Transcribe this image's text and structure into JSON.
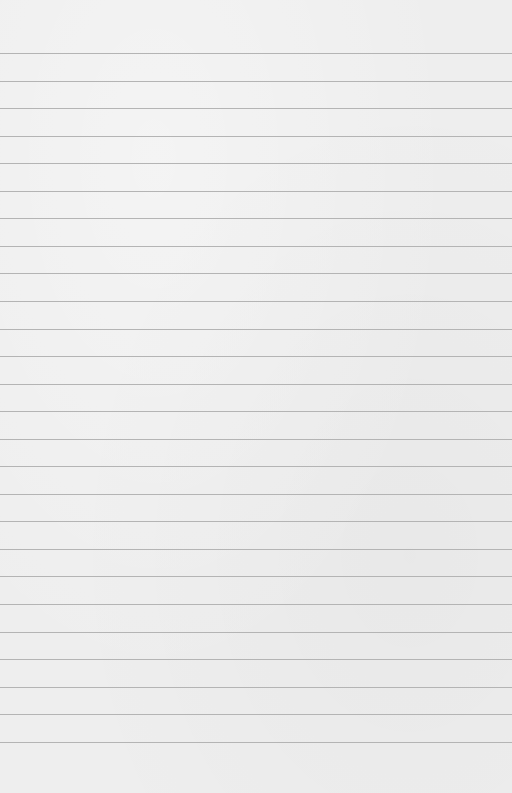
{
  "paper": {
    "background_color": "#eeeeee",
    "line_color": "#b4b4b4",
    "first_line_y": 53,
    "line_spacing": 27.55,
    "line_count": 26
  }
}
